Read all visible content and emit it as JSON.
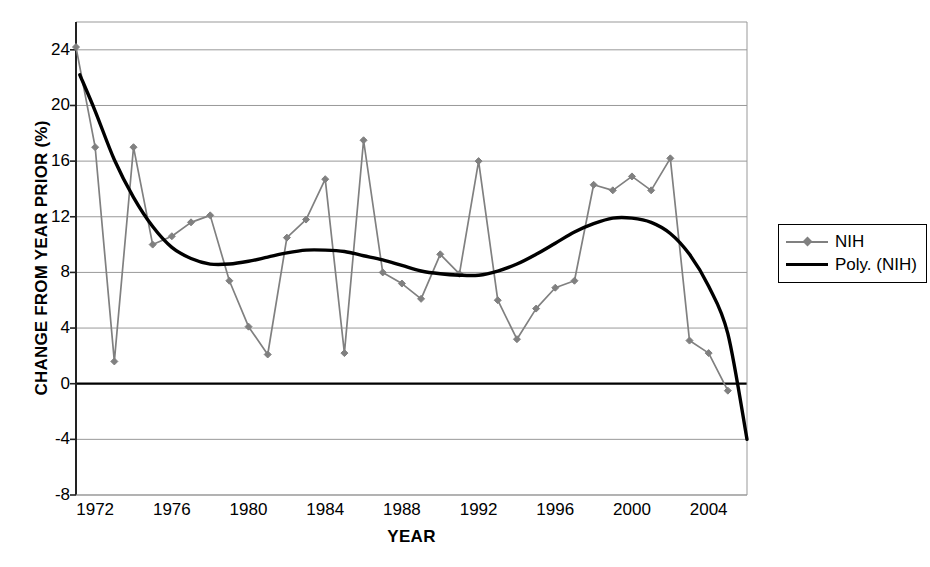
{
  "chart_data": {
    "type": "line",
    "title": "",
    "xlabel": "YEAR",
    "ylabel": "CHANGE FROM YEAR PRIOR (%)",
    "xlim": [
      1971,
      2006
    ],
    "ylim": [
      -8,
      26
    ],
    "xticks": [
      1972,
      1976,
      1980,
      1984,
      1988,
      1992,
      1996,
      2000,
      2004
    ],
    "xticklabels": [
      "1972",
      "1976",
      "1980",
      "1984",
      "1988",
      "1992",
      "1996",
      "2000",
      "2004"
    ],
    "yticks": [
      -8,
      -4,
      0,
      4,
      8,
      12,
      16,
      20,
      24
    ],
    "yticklabels": [
      "-8",
      "-4",
      "0",
      "4",
      "8",
      "12",
      "16",
      "20",
      "24"
    ],
    "grid": "horizontal",
    "legend_position": "right",
    "x": [
      1971,
      1972,
      1973,
      1974,
      1975,
      1976,
      1977,
      1978,
      1979,
      1980,
      1981,
      1982,
      1983,
      1984,
      1985,
      1986,
      1987,
      1988,
      1989,
      1990,
      1991,
      1992,
      1993,
      1994,
      1995,
      1996,
      1997,
      1998,
      1999,
      2000,
      2001,
      2002,
      2003,
      2004,
      2005
    ],
    "series": [
      {
        "name": "NIH",
        "type": "line-marker",
        "color": "#808080",
        "marker": "diamond",
        "values": [
          24.2,
          17.0,
          1.6,
          17.0,
          10.0,
          10.6,
          11.6,
          12.1,
          7.4,
          4.1,
          2.1,
          10.5,
          11.8,
          14.7,
          2.2,
          17.5,
          8.0,
          7.2,
          6.1,
          9.3,
          7.9,
          16.0,
          6.0,
          3.2,
          5.4,
          6.9,
          7.4,
          14.3,
          13.9,
          14.9,
          13.9,
          16.2,
          3.1,
          2.2,
          -0.5
        ]
      },
      {
        "name": "Poly. (NIH)",
        "type": "trendline",
        "color": "#000000",
        "x": [
          1971.2,
          1972,
          1973,
          1974,
          1975,
          1976,
          1977,
          1978,
          1979,
          1980,
          1981,
          1982,
          1983,
          1984,
          1985,
          1986,
          1987,
          1988,
          1989,
          1990,
          1991,
          1992,
          1993,
          1994,
          1995,
          1996,
          1997,
          1998,
          1999,
          2000,
          2001,
          2002,
          2003,
          2004,
          2005,
          2006
        ],
        "values": [
          22.2,
          19.6,
          16.1,
          13.4,
          11.3,
          9.8,
          9.0,
          8.6,
          8.6,
          8.8,
          9.1,
          9.4,
          9.6,
          9.6,
          9.5,
          9.2,
          8.9,
          8.5,
          8.1,
          7.9,
          7.8,
          7.8,
          8.1,
          8.6,
          9.3,
          10.1,
          10.9,
          11.5,
          11.9,
          11.9,
          11.6,
          10.8,
          9.3,
          7.0,
          3.6,
          -4.0
        ]
      }
    ],
    "legend": [
      {
        "label": "NIH",
        "key": "line-diamond-marker",
        "color": "#808080"
      },
      {
        "label": "Poly. (NIH)",
        "key": "thick-line",
        "color": "#000000"
      }
    ]
  }
}
